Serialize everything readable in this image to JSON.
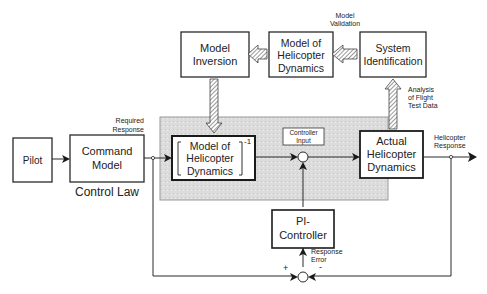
{
  "blocks": {
    "pilot": "Pilot",
    "command_model": [
      "Command",
      "Model"
    ],
    "control_law": "Control Law",
    "inverse_model": [
      "Model of",
      "Helicopter",
      "Dynamics"
    ],
    "inverse_exponent": "-1",
    "controller_input": [
      "Controller",
      "Input"
    ],
    "actual_dynamics": [
      "Actual",
      "Helicopter",
      "Dynamics"
    ],
    "model_inversion": [
      "Model",
      "Inversion"
    ],
    "model_dynamics": [
      "Model of",
      "Helicopter",
      "Dynamics"
    ],
    "system_identification": [
      "System",
      "Identification"
    ],
    "pi_controller": [
      "PI-",
      "Controller"
    ]
  },
  "annotations": {
    "required_response": [
      "Required",
      "Response"
    ],
    "model_validation": [
      "Model",
      "Validation"
    ],
    "analysis": [
      "Analysis",
      "of Flight",
      "Test Data"
    ],
    "helicopter_response": [
      "Helicopter",
      "Response"
    ],
    "response_error": [
      "Response",
      "Error"
    ],
    "plus_sign": "+",
    "minus_sign": "-"
  },
  "colors": {
    "shaded_region": "#d9d9d9",
    "line": "#2a2a2a"
  }
}
